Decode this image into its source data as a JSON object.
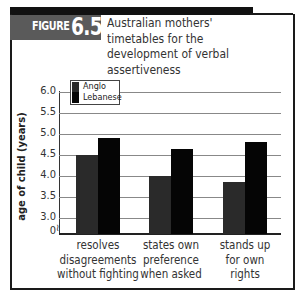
{
  "figure": {
    "label_word": "FIGURE",
    "label_number": "6.5",
    "title": "Australian mothers' timetables for the development of verbal assertiveness"
  },
  "colors": {
    "anglo": "#2a2a2a",
    "lebanese": "#050505",
    "figure_box": "#5a5a5a",
    "gridline": "#888888"
  },
  "chart_data": {
    "type": "bar",
    "title": "Australian mothers' timetables for the development of verbal assertiveness",
    "xlabel": "",
    "ylabel": "age of child (years)",
    "ylim": [
      3.0,
      6.0
    ],
    "y_axis_break": true,
    "y_ticks": [
      "6.0",
      "5.5",
      "5.0",
      "4.5",
      "4.0",
      "3.5",
      "3.0",
      "0"
    ],
    "grid": true,
    "legend_position": "top-left",
    "categories": [
      "resolves disagreements without fighting",
      "states own preference when asked",
      "stands up for own rights"
    ],
    "series": [
      {
        "name": "Anglo",
        "values": [
          4.5,
          4.0,
          3.85
        ]
      },
      {
        "name": "Lebanese",
        "values": [
          4.9,
          4.65,
          4.8
        ]
      }
    ]
  },
  "axis": {
    "ylabel": "age of child (years)",
    "ticks": [
      "6.0",
      "5.5",
      "5.0",
      "4.5",
      "4.0",
      "3.5",
      "3.0",
      "0"
    ],
    "break_symbol": "≀"
  },
  "legend": {
    "items": [
      "Anglo",
      "Lebanese"
    ]
  },
  "xlabels": [
    [
      "resolves",
      "disagreements",
      "without fighting"
    ],
    [
      "states own",
      "preference",
      "when asked"
    ],
    [
      "stands up",
      "for own",
      "rights"
    ]
  ]
}
